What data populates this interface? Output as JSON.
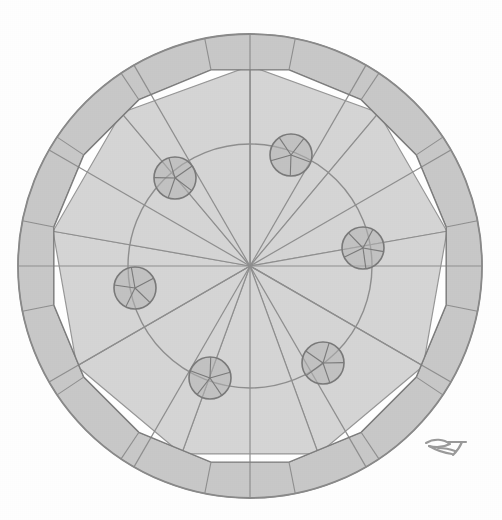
{
  "figure": {
    "caption": "",
    "background_color": "#ffffff"
  },
  "palette": {
    "fill_shade": "#c8c8c8",
    "fill_shade_light": "#d2d2d2",
    "stroke": "#8f8f8f",
    "stroke_dark": "#7d7d7d",
    "node_fill": "#b3b3b3",
    "node_stroke": "#7a7a7a",
    "white": "#ffffff",
    "signature_color": "#9a9a9a"
  },
  "geometry": {
    "center": {
      "x": 250,
      "y": 266
    },
    "outer_circle_radius": 232,
    "polygon_circle_radius": 200,
    "inner_circle_radius": 122,
    "polygon_sides": 16,
    "polygon_rotation_deg": 11.25,
    "spoke_count": 12,
    "spoke_rotation_deg": 0,
    "pinwheel_blade_count": 9,
    "pinwheel_outer_radius": 200,
    "pinwheel_lead_offset_deg": 40,
    "pinwheel_start_deg": -90
  },
  "nodes": {
    "radius": 21,
    "label": "node-circle",
    "spoke_count": 5,
    "items": [
      {
        "id": "node-1",
        "x": 291,
        "y": 155,
        "angle_deg": -70
      },
      {
        "id": "node-2",
        "x": 363,
        "y": 248,
        "angle_deg": -8
      },
      {
        "id": "node-3",
        "x": 323,
        "y": 363,
        "angle_deg": 53
      },
      {
        "id": "node-4",
        "x": 210,
        "y": 378,
        "angle_deg": 110
      },
      {
        "id": "node-5",
        "x": 135,
        "y": 288,
        "angle_deg": 170
      },
      {
        "id": "node-6",
        "x": 175,
        "y": 178,
        "angle_deg": -125
      }
    ]
  },
  "signature": {
    "name": "artist-monogram",
    "text": "RT",
    "x": 424,
    "y": 437,
    "width": 44,
    "height": 22
  }
}
